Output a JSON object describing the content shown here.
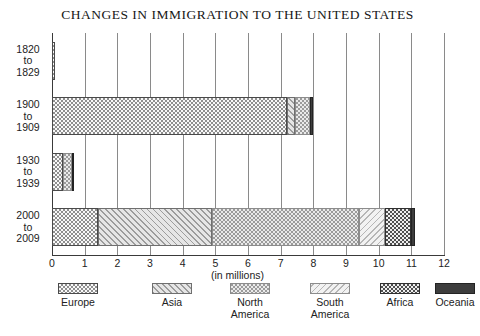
{
  "chart_data": {
    "type": "bar",
    "orientation": "horizontal",
    "stacked": true,
    "title": "CHANGES IN IMMIGRATION TO THE UNITED STATES",
    "xlabel": "(in millions)",
    "ylabel": "",
    "xlim": [
      0,
      12
    ],
    "xticks": [
      "0",
      "1",
      "2",
      "3",
      "4",
      "5",
      "6",
      "7",
      "8",
      "9",
      "10",
      "11",
      "12"
    ],
    "grid": "vertical",
    "legend_position": "bottom",
    "categories": [
      "1820 to 1829",
      "1900 to 1909",
      "1930 to 1939",
      "2000 to 2009"
    ],
    "category_lines": [
      [
        "1820",
        "to",
        "1829"
      ],
      [
        "1900",
        "to",
        "1909"
      ],
      [
        "1930",
        "to",
        "1939"
      ],
      [
        "2000",
        "to",
        "2009"
      ]
    ],
    "series": [
      {
        "name": "Europe",
        "pattern": "dark-dotted",
        "values": [
          0.1,
          7.2,
          0.35,
          1.4
        ]
      },
      {
        "name": "Asia",
        "pattern": "diagonal-hatch",
        "values": [
          0.0,
          0.25,
          0.0,
          3.5
        ]
      },
      {
        "name": "North America",
        "pattern": "light-dotted",
        "values": [
          0.0,
          0.45,
          0.25,
          4.5
        ]
      },
      {
        "name": "South America",
        "pattern": "light-back-hatch",
        "values": [
          0.0,
          0.0,
          0.0,
          0.8
        ]
      },
      {
        "name": "Africa",
        "pattern": "dark-dotted-dense",
        "values": [
          0.0,
          0.0,
          0.0,
          0.8
        ]
      },
      {
        "name": "Oceania",
        "pattern": "solid-dark",
        "values": [
          0.0,
          0.08,
          0.05,
          0.1
        ]
      }
    ],
    "totals": [
      0.1,
      7.98,
      0.65,
      11.1
    ]
  },
  "legend": {
    "items": [
      {
        "label": "Europe",
        "swatch": "europe-swatch"
      },
      {
        "label": "Asia",
        "swatch": "asia-swatch"
      },
      {
        "label": "North\nAmerica",
        "label_line1": "North",
        "label_line2": "America",
        "swatch": "north-america-swatch"
      },
      {
        "label": "South\nAmerica",
        "label_line1": "South",
        "label_line2": "America",
        "swatch": "south-america-swatch"
      },
      {
        "label": "Africa",
        "swatch": "africa-swatch"
      },
      {
        "label": "Oceania",
        "swatch": "oceania-swatch"
      }
    ]
  },
  "colors": {
    "europe": "#8f8f8f",
    "asia": "#dcdcdc",
    "north_america": "#eaeaea",
    "south_america": "#ececec",
    "africa": "#4f4f4f",
    "oceania": "#3d3d3d",
    "axis": "#3a3a3a",
    "grid": "#8a8a8a",
    "background": "#ffffff"
  }
}
